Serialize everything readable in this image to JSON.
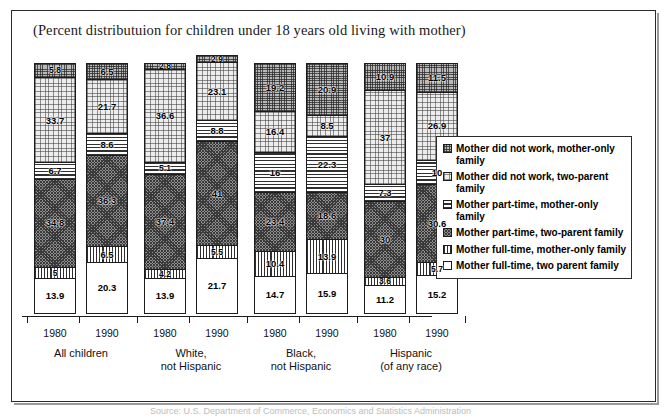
{
  "title": "(Percent distributuion for children under 18 years old living with mother)",
  "footer_note": "Source: U.S. Department of Commerce, Economics and Statistics Administration",
  "legend": {
    "items": [
      {
        "label": "Mother did not work, mother-only family",
        "key": "nw_mo",
        "pattern": "medium-gray-dots"
      },
      {
        "label": "Mother did not work, two-parent family",
        "key": "nw_two",
        "pattern": "light-fine-dots"
      },
      {
        "label": "Mother part-time, mother-only family",
        "key": "pt_mo",
        "pattern": "horizontal-stripes"
      },
      {
        "label": "Mother part-time, two-parent family",
        "key": "pt_two",
        "pattern": "dark-checker"
      },
      {
        "label": "Mother full-time, mother-only family",
        "key": "ft_mo",
        "pattern": "vertical-stripes"
      },
      {
        "label": "Mother full-time, two parent family",
        "key": "ft_two",
        "pattern": "plain-white"
      }
    ]
  },
  "chart_data": {
    "type": "bar",
    "subtype": "stacked-column",
    "title": "(Percent distributuion for children under 18 years old living with mother)",
    "xlabel": "",
    "ylabel": "",
    "ylim": [
      0,
      100
    ],
    "grid": false,
    "legend_position": "right",
    "categories": [
      "1980",
      "1990",
      "1980",
      "1990",
      "1980",
      "1990",
      "1980",
      "1990"
    ],
    "groups": [
      {
        "name": "All children",
        "line1": "All children",
        "line2": "",
        "years": [
          "1980",
          "1990"
        ]
      },
      {
        "name": "White, not Hispanic",
        "line1": "White,",
        "line2": "not Hispanic",
        "years": [
          "1980",
          "1990"
        ]
      },
      {
        "name": "Black, not Hispanic",
        "line1": "Black,",
        "line2": "not Hispanic",
        "years": [
          "1980",
          "1990"
        ]
      },
      {
        "name": "Hispanic (of any race)",
        "line1": "Hispanic",
        "line2": "(of any race)",
        "years": [
          "1980",
          "1990"
        ]
      }
    ],
    "series": [
      {
        "name": "Mother full-time, two parent family",
        "key": "ft_two",
        "values": [
          13.9,
          20.3,
          13.9,
          21.7,
          14.7,
          15.9,
          11.2,
          15.2
        ]
      },
      {
        "name": "Mother full-time, mother-only family",
        "key": "ft_mo",
        "values": [
          5,
          6.5,
          4.2,
          5.5,
          10.4,
          13.9,
          3.6,
          5.7
        ]
      },
      {
        "name": "Mother part-time, two-parent family",
        "key": "pt_two",
        "values": [
          34.8,
          36.3,
          37.4,
          41,
          23.4,
          18.6,
          30,
          30.6
        ]
      },
      {
        "name": "Mother part-time, mother-only family",
        "key": "pt_mo",
        "values": [
          6.7,
          8.6,
          5.1,
          8.8,
          16,
          22.3,
          7.3,
          10
        ]
      },
      {
        "name": "Mother did not work, two-parent family",
        "key": "nw_two",
        "values": [
          33.7,
          21.7,
          36.6,
          23.1,
          16.4,
          8.5,
          37,
          26.9
        ]
      },
      {
        "name": "Mother did not work, mother-only family",
        "key": "nw_mo",
        "values": [
          5.8,
          6.5,
          2.8,
          2.9,
          19.2,
          20.9,
          10.9,
          11.5
        ]
      }
    ],
    "bars": [
      {
        "group": "All children",
        "year": "1980",
        "segments": [
          {
            "key": "ft_two",
            "label": "13.9",
            "value": 13.9
          },
          {
            "key": "ft_mo",
            "label": "5",
            "value": 5
          },
          {
            "key": "pt_two",
            "label": "34.8",
            "value": 34.8
          },
          {
            "key": "pt_mo",
            "label": "6.7",
            "value": 6.7
          },
          {
            "key": "nw_two",
            "label": "33.7",
            "value": 33.7
          },
          {
            "key": "nw_mo",
            "label": "5.8",
            "value": 5.8
          }
        ]
      },
      {
        "group": "All children",
        "year": "1990",
        "segments": [
          {
            "key": "ft_two",
            "label": "20.3",
            "value": 20.3
          },
          {
            "key": "ft_mo",
            "label": "6.5",
            "value": 6.5
          },
          {
            "key": "pt_two",
            "label": "36.3",
            "value": 36.3
          },
          {
            "key": "pt_mo",
            "label": "8.6",
            "value": 8.6
          },
          {
            "key": "nw_two",
            "label": "21.7",
            "value": 21.7
          },
          {
            "key": "nw_mo",
            "label": "6.5",
            "value": 6.5
          }
        ]
      },
      {
        "group": "White, not Hispanic",
        "year": "1980",
        "segments": [
          {
            "key": "ft_two",
            "label": "13.9",
            "value": 13.9
          },
          {
            "key": "ft_mo",
            "label": "4.2",
            "value": 4.2
          },
          {
            "key": "pt_two",
            "label": "37.4",
            "value": 37.4
          },
          {
            "key": "pt_mo",
            "label": "5.1",
            "value": 5.1
          },
          {
            "key": "nw_two",
            "label": "36.6",
            "value": 36.6
          },
          {
            "key": "nw_mo",
            "label": "2.8",
            "value": 2.8
          }
        ]
      },
      {
        "group": "White, not Hispanic",
        "year": "1990",
        "segments": [
          {
            "key": "ft_two",
            "label": "21.7",
            "value": 21.7
          },
          {
            "key": "ft_mo",
            "label": "5.5",
            "value": 5.5
          },
          {
            "key": "pt_two",
            "label": "41",
            "value": 41
          },
          {
            "key": "pt_mo",
            "label": "8.8",
            "value": 8.8
          },
          {
            "key": "nw_two",
            "label": "23.1",
            "value": 23.1
          },
          {
            "key": "nw_mo",
            "label": "2.9",
            "value": 2.9
          }
        ]
      },
      {
        "group": "Black, not Hispanic",
        "year": "1980",
        "segments": [
          {
            "key": "ft_two",
            "label": "14.7",
            "value": 14.7
          },
          {
            "key": "ft_mo",
            "label": "10.4",
            "value": 10.4
          },
          {
            "key": "pt_two",
            "label": "23.4",
            "value": 23.4
          },
          {
            "key": "pt_mo",
            "label": "16",
            "value": 16
          },
          {
            "key": "nw_two",
            "label": "16.4",
            "value": 16.4
          },
          {
            "key": "nw_mo",
            "label": "19.2",
            "value": 19.2
          }
        ]
      },
      {
        "group": "Black, not Hispanic",
        "year": "1990",
        "segments": [
          {
            "key": "ft_two",
            "label": "15.9",
            "value": 15.9
          },
          {
            "key": "ft_mo",
            "label": "13.9",
            "value": 13.9
          },
          {
            "key": "pt_two",
            "label": "18.6",
            "value": 18.6
          },
          {
            "key": "pt_mo",
            "label": "22.3",
            "value": 22.3
          },
          {
            "key": "nw_two",
            "label": "8.5",
            "value": 8.5
          },
          {
            "key": "nw_mo",
            "label": "20.9",
            "value": 20.9
          }
        ]
      },
      {
        "group": "Hispanic (of any race)",
        "year": "1980",
        "segments": [
          {
            "key": "ft_two",
            "label": "11.2",
            "value": 11.2
          },
          {
            "key": "ft_mo",
            "label": "3.6",
            "value": 3.6
          },
          {
            "key": "pt_two",
            "label": "30",
            "value": 30
          },
          {
            "key": "pt_mo",
            "label": "7.3",
            "value": 7.3
          },
          {
            "key": "nw_two",
            "label": "37",
            "value": 37
          },
          {
            "key": "nw_mo",
            "label": "10.9",
            "value": 10.9
          }
        ]
      },
      {
        "group": "Hispanic (of any race)",
        "year": "1990",
        "segments": [
          {
            "key": "ft_two",
            "label": "15.2",
            "value": 15.2
          },
          {
            "key": "ft_mo",
            "label": "5.7",
            "value": 5.7
          },
          {
            "key": "pt_two",
            "label": "30.6",
            "value": 30.6
          },
          {
            "key": "pt_mo",
            "label": "10",
            "value": 10
          },
          {
            "key": "nw_two",
            "label": "26.9",
            "value": 26.9
          },
          {
            "key": "nw_mo",
            "label": "11.5",
            "value": 11.5
          }
        ]
      }
    ]
  }
}
